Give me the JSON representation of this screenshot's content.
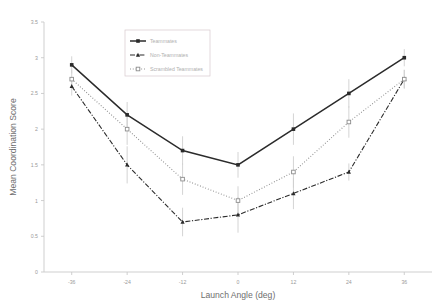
{
  "chart_data": {
    "type": "line",
    "title": "",
    "xlabel": "Launch Angle (deg)",
    "ylabel": "Mean Coordination Score",
    "x": [
      -36,
      -24,
      -12,
      0,
      12,
      24,
      36
    ],
    "xtick_labels": [
      "-36",
      "-24",
      "-12",
      "0",
      "12",
      "24",
      "36"
    ],
    "ytick_labels": [
      "0",
      "0.5",
      "1",
      "1.5",
      "2",
      "2.5",
      "3",
      "3.5"
    ],
    "ytick_values": [
      0,
      0.5,
      1,
      1.5,
      2,
      2.5,
      3,
      3.5
    ],
    "xlim": [
      -42,
      42
    ],
    "ylim": [
      0,
      3.5
    ],
    "grid": false,
    "legend_position": "upper-center-left",
    "series": [
      {
        "name": "Teammates",
        "values": [
          2.9,
          2.2,
          1.7,
          1.5,
          2.0,
          2.5,
          3.0
        ],
        "errors": [
          0.12,
          0.18,
          0.2,
          0.18,
          0.22,
          0.2,
          0.12
        ],
        "line_style": "solid",
        "marker": "filled-square",
        "color": "#2b2b2b"
      },
      {
        "name": "Non-Teammates",
        "values": [
          2.6,
          1.5,
          0.7,
          0.8,
          1.1,
          1.4,
          2.7
        ],
        "errors": [
          0.13,
          0.26,
          0.2,
          0.25,
          0.22,
          0.12,
          0.13
        ],
        "line_style": "dashdot",
        "marker": "filled-triangle",
        "color": "#2b2b2b"
      },
      {
        "name": "Scrambled Teammates",
        "values": [
          2.7,
          2.0,
          1.3,
          1.0,
          1.4,
          2.1,
          2.7
        ],
        "errors": [
          0.13,
          0.22,
          0.22,
          0.2,
          0.22,
          0.22,
          0.13
        ],
        "line_style": "dotted",
        "marker": "open-square",
        "color": "#8c8c8c"
      }
    ],
    "error_bar_color": "#cfcfcf",
    "axis_color": "#c9c9c9",
    "tick_label_color": "#9a9a9a",
    "axis_title_color": "#6e6e6e"
  },
  "legend": {
    "entries": [
      {
        "label": "Teammates"
      },
      {
        "label": "Non-Teammates"
      },
      {
        "label": "Scrambled Teammates"
      }
    ]
  },
  "axes": {
    "x_title": "Launch Angle (deg)",
    "y_title": "Mean Coordination Score"
  }
}
